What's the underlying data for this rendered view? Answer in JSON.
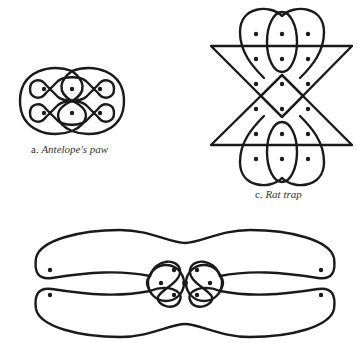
{
  "figures": [
    {
      "id": "a",
      "letter": "a.",
      "name": "Antelope's paw",
      "caption_position": {
        "x": 31,
        "y": 143
      }
    },
    {
      "id": "c",
      "letter": "c.",
      "name": "Rat trap",
      "caption_position": {
        "x": 255,
        "y": 188
      }
    },
    {
      "id": "bottom",
      "letter": "",
      "name": ""
    }
  ],
  "colors": {
    "stroke": "#1a1a1a",
    "background": "#ffffff",
    "caption": "#333333"
  }
}
